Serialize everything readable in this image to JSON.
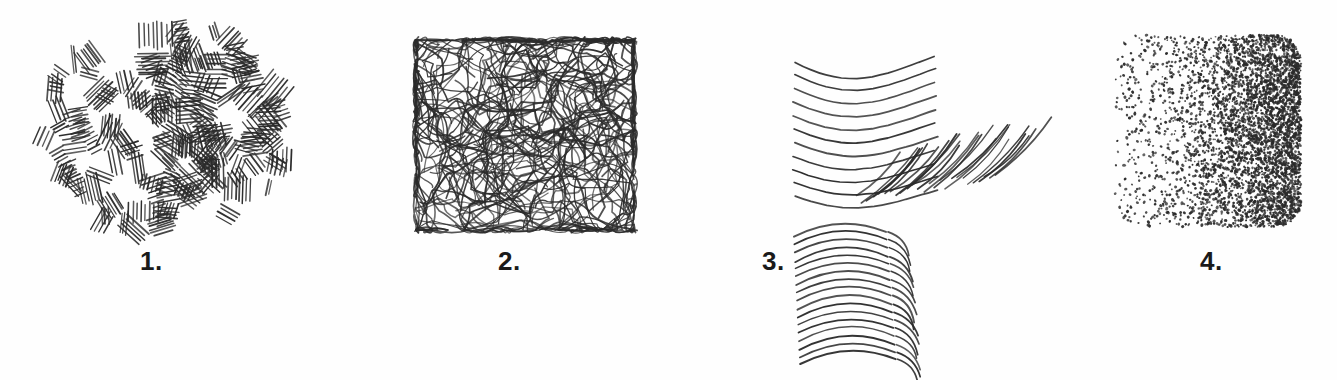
{
  "figure": {
    "background_color": "#fefefe",
    "ink_color": "#2b2b2b",
    "label_color": "#1a1a1a",
    "width": 1337,
    "height": 380
  },
  "panels": [
    {
      "label": "1.",
      "technique": "straight-hatching-clusters",
      "description": "Patches of short straight parallel strokes, each patch at a random angle",
      "label_x": 140,
      "label_y": 248,
      "region": {
        "x": 40,
        "y": 30,
        "width": 248,
        "height": 202
      },
      "stroke_width": 1.5,
      "cluster_count": 150,
      "strokes_per_cluster": 6
    },
    {
      "label": "2.",
      "technique": "random-scribble-crosshatch",
      "description": "Dense tangled continuous wandering lines forming a dark mass",
      "label_x": 498,
      "label_y": 248,
      "region": {
        "x": 414,
        "y": 38,
        "width": 222,
        "height": 194
      },
      "stroke_width": 1.6,
      "scribble_count": 150,
      "segments_per_scribble": 9
    },
    {
      "label": "3.",
      "technique": "contour-curved-hatching",
      "description": "Parallel sagging curved lines with diagonal crosshatch at right, plus nested arcs following a cylindrical form below",
      "label_x": 762,
      "label_y": 248,
      "region": {
        "x": 790,
        "y": 50,
        "width": 200,
        "height": 310
      },
      "stroke_width": 1.7,
      "curve_count": 11,
      "crosshatch_count": 26,
      "arc_count": 17
    },
    {
      "label": "4.",
      "technique": "stippling-gradient",
      "description": "Dots with density gradient from sparse at left to very dense at right",
      "label_x": 1200,
      "label_y": 248,
      "region": {
        "x": 1112,
        "y": 32,
        "width": 192,
        "height": 198
      },
      "dot_radius": 1.15,
      "dot_count": 4200,
      "density_left": 0.06,
      "density_right": 1.0
    }
  ]
}
